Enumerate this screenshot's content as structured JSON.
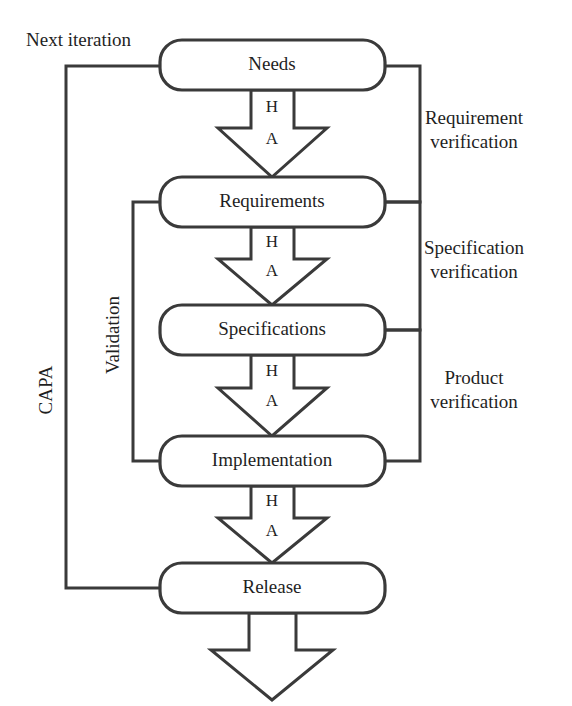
{
  "diagram": {
    "colors": {
      "stroke": "#3a3a3a",
      "fill": "#ffffff",
      "text": "#1f1f1f"
    },
    "boxes": [
      {
        "id": "needs",
        "label": "Needs"
      },
      {
        "id": "requirements",
        "label": "Requirements"
      },
      {
        "id": "specifications",
        "label": "Specifications"
      },
      {
        "id": "implementation",
        "label": "Implementation"
      },
      {
        "id": "release",
        "label": "Release"
      }
    ],
    "flow_arrows": [
      {
        "id": "needs-to-requirements",
        "upper": "H",
        "lower": "A"
      },
      {
        "id": "requirements-to-specifications",
        "upper": "H",
        "lower": "A"
      },
      {
        "id": "specifications-to-implementation",
        "upper": "H",
        "lower": "A"
      },
      {
        "id": "implementation-to-release",
        "upper": "H",
        "lower": "A"
      }
    ],
    "output_arrow": {
      "id": "release-output",
      "label": ""
    },
    "right_labels": [
      {
        "id": "requirement-verification",
        "line1": "Requirement",
        "line2": "verification"
      },
      {
        "id": "specification-verification",
        "line1": "Specification",
        "line2": "verification"
      },
      {
        "id": "product-verification",
        "line1": "Product",
        "line2": "verification"
      }
    ],
    "left_labels": [
      {
        "id": "capa",
        "label": "CAPA"
      },
      {
        "id": "validation",
        "label": "Validation"
      }
    ],
    "top_label": {
      "id": "next-iteration",
      "label": "Next iteration"
    }
  }
}
